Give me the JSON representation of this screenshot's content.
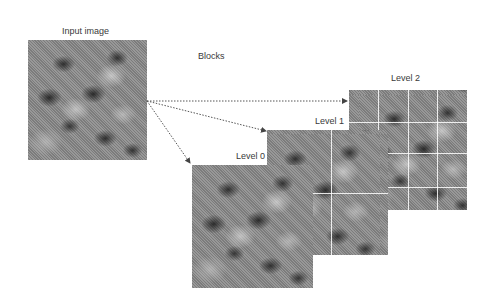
{
  "diagram": {
    "input_label": "Input image",
    "blocks_label": "Blocks",
    "levels": [
      {
        "label": "Level 0",
        "grid": "1x1"
      },
      {
        "label": "Level 1",
        "grid": "2x2"
      },
      {
        "label": "Level 2",
        "grid": "4x4"
      }
    ],
    "arrows": [
      {
        "from": "input-image",
        "to": "level-2",
        "style": "dotted"
      },
      {
        "from": "input-image",
        "to": "level-1",
        "style": "dotted"
      },
      {
        "from": "input-image",
        "to": "level-0",
        "style": "dotted"
      }
    ],
    "colors": {
      "background": "#ffffff",
      "text": "#3a3a3a",
      "arrow": "#555555",
      "grid_line": "#ffffff"
    }
  }
}
